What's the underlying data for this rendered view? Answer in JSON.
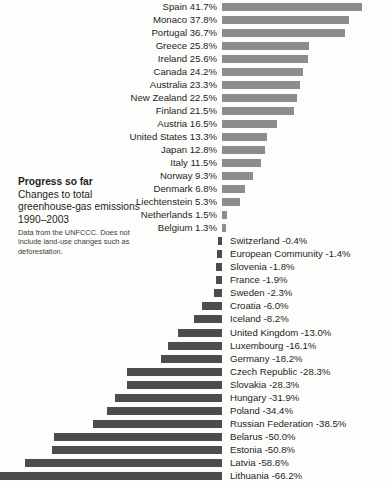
{
  "caption": {
    "heading": "Progress so far",
    "subtitle": "Changes to total greenhouse-gas emissions 1990–2003",
    "note": "Data from the UNFCCC. Does not include land-use changes such as deforestation."
  },
  "colors": {
    "background": "#fdfdfc",
    "positive_bar": "#8d8d8d",
    "negative_bar": "#4c4c4c",
    "text": "#1d1d1b"
  },
  "chart_data": {
    "type": "bar",
    "orientation": "horizontal",
    "title": "Progress so far",
    "subtitle": "Changes to total greenhouse-gas emissions 1990–2003",
    "annotation": "Data from the UNFCCC. Does not include land-use changes such as deforestation.",
    "xlabel": "",
    "ylabel": "",
    "unit": "%",
    "xlim": [
      -66.2,
      41.7
    ],
    "grid": false,
    "legend": false,
    "categories": [
      "Spain",
      "Monaco",
      "Portugal",
      "Greece",
      "Ireland",
      "Canada",
      "Australia",
      "New Zealand",
      "Finland",
      "Austria",
      "United States",
      "Japan",
      "Italy",
      "Norway",
      "Denmark",
      "Liechtenstein",
      "Netherlands",
      "Belgium",
      "Switzerland",
      "European Community",
      "Slovenia",
      "France",
      "Sweden",
      "Croatia",
      "Iceland",
      "United Kingdom",
      "Luxembourg",
      "Germany",
      "Czech Republic",
      "Slovakia",
      "Hungary",
      "Poland",
      "Russian Federation",
      "Belarus",
      "Estonia",
      "Latvia",
      "Lithuania"
    ],
    "values": [
      41.7,
      37.8,
      36.7,
      25.8,
      25.6,
      24.2,
      23.3,
      22.5,
      21.5,
      16.5,
      13.3,
      12.8,
      11.5,
      9.3,
      6.8,
      5.3,
      1.5,
      1.3,
      -0.4,
      -1.4,
      -1.8,
      -1.9,
      -2.3,
      -6.0,
      -8.2,
      -13.0,
      -16.1,
      -18.2,
      -28.3,
      -28.3,
      -31.9,
      -34.4,
      -38.5,
      -50.0,
      -50.8,
      -58.8,
      -66.2
    ],
    "rows": [
      {
        "label": "Spain 41.7%",
        "name": "Spain",
        "value": 41.7,
        "sign": "pos"
      },
      {
        "label": "Monaco 37.8%",
        "name": "Monaco",
        "value": 37.8,
        "sign": "pos"
      },
      {
        "label": "Portugal 36.7%",
        "name": "Portugal",
        "value": 36.7,
        "sign": "pos"
      },
      {
        "label": "Greece 25.8%",
        "name": "Greece",
        "value": 25.8,
        "sign": "pos"
      },
      {
        "label": "Ireland 25.6%",
        "name": "Ireland",
        "value": 25.6,
        "sign": "pos"
      },
      {
        "label": "Canada 24.2%",
        "name": "Canada",
        "value": 24.2,
        "sign": "pos"
      },
      {
        "label": "Australia 23.3%",
        "name": "Australia",
        "value": 23.3,
        "sign": "pos"
      },
      {
        "label": "New Zealand 22.5%",
        "name": "New Zealand",
        "value": 22.5,
        "sign": "pos"
      },
      {
        "label": "Finland 21.5%",
        "name": "Finland",
        "value": 21.5,
        "sign": "pos"
      },
      {
        "label": "Austria 16.5%",
        "name": "Austria",
        "value": 16.5,
        "sign": "pos"
      },
      {
        "label": "United States 13.3%",
        "name": "United States",
        "value": 13.3,
        "sign": "pos"
      },
      {
        "label": "Japan 12.8%",
        "name": "Japan",
        "value": 12.8,
        "sign": "pos"
      },
      {
        "label": "Italy 11.5%",
        "name": "Italy",
        "value": 11.5,
        "sign": "pos"
      },
      {
        "label": "Norway 9.3%",
        "name": "Norway",
        "value": 9.3,
        "sign": "pos"
      },
      {
        "label": "Denmark 6.8%",
        "name": "Denmark",
        "value": 6.8,
        "sign": "pos"
      },
      {
        "label": "Liechtenstein 5.3%",
        "name": "Liechtenstein",
        "value": 5.3,
        "sign": "pos"
      },
      {
        "label": "Netherlands 1.5%",
        "name": "Netherlands",
        "value": 1.5,
        "sign": "pos"
      },
      {
        "label": "Belgium 1.3%",
        "name": "Belgium",
        "value": 1.3,
        "sign": "pos"
      },
      {
        "label": "Switzerland -0.4%",
        "name": "Switzerland",
        "value": -0.4,
        "sign": "neg"
      },
      {
        "label": "European Community -1.4%",
        "name": "European Community",
        "value": -1.4,
        "sign": "neg"
      },
      {
        "label": "Slovenia -1.8%",
        "name": "Slovenia",
        "value": -1.8,
        "sign": "neg"
      },
      {
        "label": "France -1.9%",
        "name": "France",
        "value": -1.9,
        "sign": "neg"
      },
      {
        "label": "Sweden -2.3%",
        "name": "Sweden",
        "value": -2.3,
        "sign": "neg"
      },
      {
        "label": "Croatia -6.0%",
        "name": "Croatia",
        "value": -6.0,
        "sign": "neg"
      },
      {
        "label": "Iceland -8.2%",
        "name": "Iceland",
        "value": -8.2,
        "sign": "neg"
      },
      {
        "label": "United Kingdom -13.0%",
        "name": "United Kingdom",
        "value": -13.0,
        "sign": "neg"
      },
      {
        "label": "Luxembourg -16.1%",
        "name": "Luxembourg",
        "value": -16.1,
        "sign": "neg"
      },
      {
        "label": "Germany -18.2%",
        "name": "Germany",
        "value": -18.2,
        "sign": "neg"
      },
      {
        "label": "Czech Republic -28.3%",
        "name": "Czech Republic",
        "value": -28.3,
        "sign": "neg"
      },
      {
        "label": "Slovakia -28.3%",
        "name": "Slovakia",
        "value": -28.3,
        "sign": "neg"
      },
      {
        "label": "Hungary -31.9%",
        "name": "Hungary",
        "value": -31.9,
        "sign": "neg"
      },
      {
        "label": "Poland -34.4%",
        "name": "Poland",
        "value": -34.4,
        "sign": "neg"
      },
      {
        "label": "Russian Federation -38.5%",
        "name": "Russian Federation",
        "value": -38.5,
        "sign": "neg"
      },
      {
        "label": "Belarus -50.0%",
        "name": "Belarus",
        "value": -50.0,
        "sign": "neg"
      },
      {
        "label": "Estonia -50.8%",
        "name": "Estonia",
        "value": -50.8,
        "sign": "neg"
      },
      {
        "label": "Latvia -58.8%",
        "name": "Latvia",
        "value": -58.8,
        "sign": "neg"
      },
      {
        "label": "Lithuania -66.2%",
        "name": "Lithuania",
        "value": -66.2,
        "sign": "neg"
      }
    ]
  },
  "layout": {
    "zero_axis_x": 222,
    "px_per_percent": 3.355,
    "row_pitch": 13.02,
    "first_row_top": 1,
    "min_bar_px": 4
  }
}
